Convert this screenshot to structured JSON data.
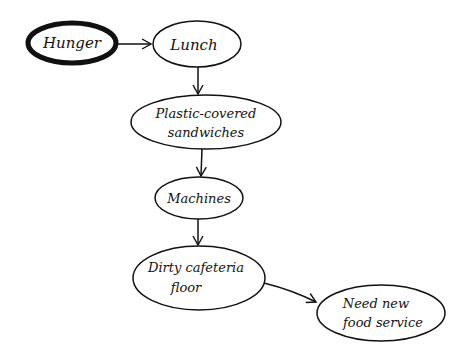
{
  "diagram": {
    "type": "flowchart",
    "colors": {
      "stroke": "#111111",
      "background": "#ffffff"
    },
    "nodes": [
      {
        "id": "hunger",
        "lines": [
          "Hunger"
        ],
        "cx": 72,
        "cy": 43,
        "rx": 44,
        "ry": 20,
        "emphasis": true
      },
      {
        "id": "lunch",
        "lines": [
          "Lunch"
        ],
        "cx": 197,
        "cy": 44,
        "rx": 44,
        "ry": 23,
        "emphasis": false
      },
      {
        "id": "sandwiches",
        "lines": [
          "Plastic-covered",
          "sandwiches"
        ],
        "cx": 206,
        "cy": 122,
        "rx": 75,
        "ry": 27,
        "emphasis": false
      },
      {
        "id": "machines",
        "lines": [
          "Machines"
        ],
        "cx": 199,
        "cy": 198,
        "rx": 44,
        "ry": 21,
        "emphasis": false
      },
      {
        "id": "floor",
        "lines": [
          "Dirty cafeteria",
          "floor"
        ],
        "cx": 199,
        "cy": 278,
        "rx": 66,
        "ry": 32,
        "emphasis": false
      },
      {
        "id": "food_service",
        "lines": [
          "Need new",
          "food service"
        ],
        "cx": 381,
        "cy": 313,
        "rx": 64,
        "ry": 28,
        "emphasis": false
      }
    ],
    "edges": [
      {
        "from": "hunger",
        "to": "lunch"
      },
      {
        "from": "lunch",
        "to": "sandwiches"
      },
      {
        "from": "sandwiches",
        "to": "machines"
      },
      {
        "from": "machines",
        "to": "floor"
      },
      {
        "from": "floor",
        "to": "food_service"
      }
    ]
  }
}
